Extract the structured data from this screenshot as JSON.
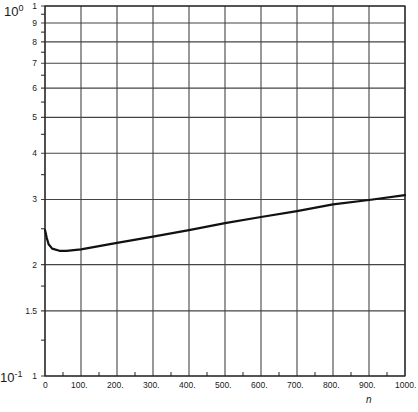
{
  "chart_data": {
    "type": "line",
    "title": "",
    "xlabel": "n",
    "ylabel": "",
    "x_scale": "linear",
    "y_scale": "log",
    "xlim": [
      0,
      1000
    ],
    "ylim_mantissa": [
      1,
      10
    ],
    "decade_labels": {
      "top": "10^0",
      "bottom": "10^-1"
    },
    "x_ticks": [
      0,
      100,
      200,
      300,
      400,
      500,
      600,
      700,
      800,
      900,
      1000
    ],
    "x_tick_labels": [
      "0",
      "100.",
      "200.",
      "300.",
      "400.",
      "500.",
      "600.",
      "700.",
      "800.",
      "900.",
      "1000."
    ],
    "y_ticks": [
      1,
      1.5,
      2,
      3,
      4,
      5,
      6,
      7,
      8,
      9,
      10
    ],
    "y_tick_labels": [
      "1",
      "1.5",
      "2",
      "3",
      "4",
      "5",
      "6",
      "7",
      "8",
      "9",
      "1"
    ],
    "grid": true,
    "legend": null,
    "series": [
      {
        "name": "curve",
        "x": [
          0,
          5,
          10,
          20,
          40,
          60,
          100,
          200,
          300,
          400,
          500,
          600,
          700,
          800,
          900,
          1000
        ],
        "values": [
          2.48,
          2.36,
          2.27,
          2.21,
          2.18,
          2.18,
          2.2,
          2.29,
          2.38,
          2.48,
          2.59,
          2.69,
          2.79,
          2.91,
          2.99,
          3.08
        ]
      }
    ]
  },
  "labels": {
    "decade_top_base": "10",
    "decade_top_exp": "0",
    "decade_bottom_base": "10",
    "decade_bottom_exp": "-1",
    "x_axis_name": "n"
  }
}
